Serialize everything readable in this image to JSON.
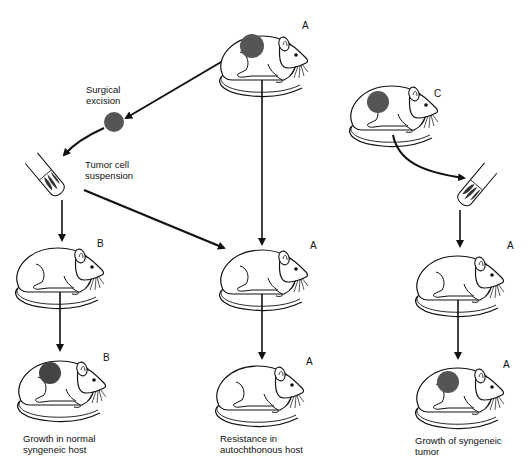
{
  "diagram": {
    "type": "tumor transplantation experiment",
    "labels": {
      "surgical_excision": "Surgical\nexcision",
      "tumor_cell_suspension": "Tumor cell\nsuspension",
      "caption_left": "Growth in normal\nsyngeneic host",
      "caption_middle": "Resistance in\nautochthonous host",
      "caption_right": "Growth of syngeneic\ntumor"
    },
    "mouse_tags": {
      "top_a": "A",
      "left_mid_b": "B",
      "left_bottom_b": "B",
      "middle_mid_a": "A",
      "middle_bottom_a": "A",
      "right_top_c": "C",
      "right_mid_a": "A",
      "right_bottom_a": "A"
    },
    "nodes": [
      {
        "id": "mouse-a-top",
        "strain": "A",
        "tumor": true
      },
      {
        "id": "excised-tumor",
        "kind": "tumor"
      },
      {
        "id": "tube-left",
        "kind": "tumor cell suspension"
      },
      {
        "id": "mouse-b-mid",
        "strain": "B",
        "tumor": false
      },
      {
        "id": "mouse-b-bottom",
        "strain": "B",
        "tumor": true
      },
      {
        "id": "mouse-a-mid",
        "strain": "A",
        "tumor": false
      },
      {
        "id": "mouse-a-bottom",
        "strain": "A",
        "tumor": false
      },
      {
        "id": "mouse-c-top",
        "strain": "C",
        "tumor": true
      },
      {
        "id": "tube-right",
        "kind": "tumor cell suspension"
      },
      {
        "id": "mouse-a-right-mid",
        "strain": "A",
        "tumor": false
      },
      {
        "id": "mouse-a-right-bottom",
        "strain": "A",
        "tumor": true
      }
    ],
    "edges": [
      [
        "mouse-a-top",
        "excised-tumor"
      ],
      [
        "excised-tumor",
        "tube-left"
      ],
      [
        "tube-left",
        "mouse-b-mid"
      ],
      [
        "mouse-b-mid",
        "mouse-b-bottom"
      ],
      [
        "tube-left",
        "mouse-a-mid"
      ],
      [
        "mouse-a-top",
        "mouse-a-mid"
      ],
      [
        "mouse-a-mid",
        "mouse-a-bottom"
      ],
      [
        "mouse-c-top",
        "tube-right"
      ],
      [
        "tube-right",
        "mouse-a-right-mid"
      ],
      [
        "mouse-a-right-mid",
        "mouse-a-right-bottom"
      ]
    ],
    "colors": {
      "line": "#111111",
      "tumor": "#555555",
      "background": "#ffffff"
    }
  }
}
